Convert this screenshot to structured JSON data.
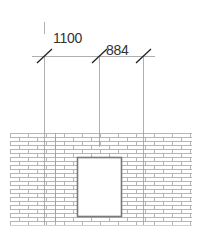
{
  "drawing": {
    "type": "architectural-elevation",
    "dimensions": [
      {
        "label": "1100",
        "from_x": 44,
        "to_x": 99
      },
      {
        "label": "884",
        "from_x": 99,
        "to_x": 143
      }
    ],
    "wall": {
      "material": "brick",
      "x": 10,
      "y": 133,
      "width": 182,
      "height": 92
    },
    "opening": {
      "type": "window",
      "x": 77,
      "y": 157,
      "width": 44,
      "height": 59
    },
    "colors": {
      "line": "#9a9a9a",
      "tick": "#222222",
      "brick": "#b5b5b5",
      "opening_frame": "#7a7a7a",
      "text": "#333333"
    }
  }
}
